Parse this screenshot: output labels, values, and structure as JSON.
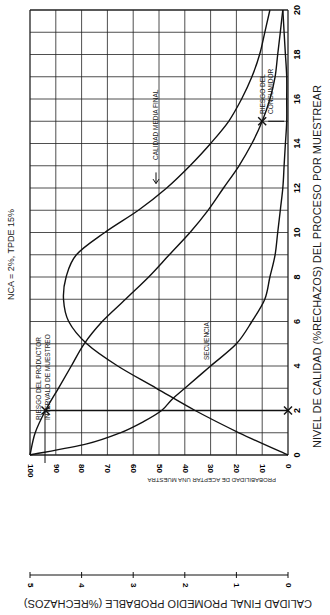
{
  "chart_data": {
    "type": "line",
    "orientation": "rotated 90 degrees clockwise",
    "title": "NCA = 2%, TPDE 15%",
    "xlabel": "NIVEL DE CALIDAD (%RECHAZOS) DEL PROCESO POR MUESTREAR",
    "ylabel_left": "PROBABILIDAD DE ACEPTAR UNA MUESTRA",
    "ylabel_right": "CALIDAD FINAL PROMEDIO PROBABLE (%RECHAZOS)",
    "xlim": [
      0,
      20
    ],
    "ylim_left": [
      0,
      100
    ],
    "ylim_right": [
      0,
      5
    ],
    "x_ticks": [
      "0",
      "2",
      "4",
      "6",
      "8",
      "10",
      "12",
      "14",
      "16",
      "18",
      "20"
    ],
    "y_ticks_left": [
      "0",
      "10",
      "20",
      "30",
      "40",
      "50",
      "60",
      "70",
      "80",
      "90",
      "100"
    ],
    "y_ticks_right": [
      "0",
      "1",
      "2",
      "3",
      "4",
      "5"
    ],
    "grid": true,
    "series": [
      {
        "name": "Curva OC (probabilidad de aceptar)",
        "axis": "left",
        "x": [
          0,
          1,
          2,
          3,
          4,
          5,
          6,
          7,
          8,
          9,
          10,
          11,
          12,
          13,
          14,
          15,
          16,
          17,
          18,
          19,
          20
        ],
        "values": [
          100,
          98,
          94,
          89,
          84,
          79,
          72,
          63,
          54,
          46,
          38,
          31,
          25,
          19,
          14,
          10,
          7,
          5,
          4,
          3,
          2
        ]
      },
      {
        "name": "Calidad media final",
        "axis": "right",
        "x": [
          0,
          1,
          2,
          3,
          4,
          5,
          6,
          7,
          8,
          9,
          10,
          11,
          12,
          13,
          14,
          15,
          16,
          17,
          18,
          19,
          20
        ],
        "values": [
          0,
          0.95,
          1.8,
          2.55,
          3.3,
          3.9,
          4.25,
          4.35,
          4.3,
          4.1,
          3.55,
          2.9,
          2.35,
          1.9,
          1.5,
          1.15,
          0.9,
          0.7,
          0.55,
          0.45,
          0.35
        ]
      },
      {
        "name": "Secuencia",
        "axis": "left",
        "x": [
          0,
          0.5,
          1,
          1.5,
          2,
          2.5,
          3,
          4,
          5,
          6,
          7,
          8,
          9,
          10,
          11,
          12,
          13,
          14,
          15,
          16,
          17,
          18,
          19,
          20
        ],
        "values": [
          100,
          78,
          65,
          56,
          49,
          45,
          40,
          30,
          20,
          14,
          9,
          7,
          5,
          4,
          3,
          2,
          1.5,
          1,
          0.5,
          0.5,
          0.5,
          1,
          1.5,
          2
        ]
      }
    ],
    "annotations": [
      {
        "text": "RIESGO DEL PRODUCTOR",
        "x": 2,
        "y": 94
      },
      {
        "text": "INTERVALO DE MUESTREO",
        "x": 2,
        "y": 94
      },
      {
        "text": "RIESGO DEL CONSUMIDOR",
        "x": 15,
        "y": 10
      },
      {
        "text": "CALIDAD MEDIA FINAL",
        "x": 12.5,
        "y": 2.5
      },
      {
        "text": "SECUENCIA",
        "x": 4,
        "y": 32
      }
    ],
    "markers": [
      {
        "x": 2,
        "y": 94,
        "shape": "x"
      },
      {
        "x": 2,
        "y": 0,
        "shape": "x"
      },
      {
        "x": 15,
        "y": 10,
        "shape": "x"
      }
    ]
  },
  "labels": {
    "title": "NCA = 2%, TPDE 15%",
    "xlabel": "NIVEL DE CALIDAD (%RECHAZOS) DEL PROCESO POR MUESTREAR",
    "ylabel_left": "PROBABILIDAD DE ACEPTAR UNA MUESTRA",
    "ylabel_right": "CALIDAD FINAL PROMEDIO PROBABLE (%RECHAZOS)",
    "producer_risk": "RIESGO DEL PRODUCTOR",
    "sampling_interval": "INTERVALO DE MUESTREO",
    "consumer_risk_1": "RIESGO DEL",
    "consumer_risk_2": "CONSUMIDOR",
    "aoq_label": "CALIDAD MEDIA FINAL",
    "asn_label": "SECUENCIA"
  }
}
